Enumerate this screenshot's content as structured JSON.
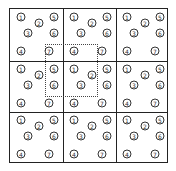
{
  "diagram": {
    "rows": 3,
    "cols": 3,
    "cell_width": 53,
    "cell_height": 51.5,
    "line_color": "#222222",
    "nodes": [
      {
        "label": "1",
        "dx": 11,
        "dy": 8
      },
      {
        "label": "2",
        "dx": 29,
        "dy": 14
      },
      {
        "label": "3",
        "dx": 18,
        "dy": 24
      },
      {
        "label": "5",
        "dx": 44,
        "dy": 8
      },
      {
        "label": "6",
        "dx": 44,
        "dy": 24
      },
      {
        "label": "4",
        "dx": 11,
        "dy": 42
      },
      {
        "label": "7",
        "dx": 39,
        "dy": 42
      }
    ],
    "selection": {
      "left": 35,
      "top": 35,
      "width": 53,
      "height": 53,
      "style": "dotted"
    }
  }
}
